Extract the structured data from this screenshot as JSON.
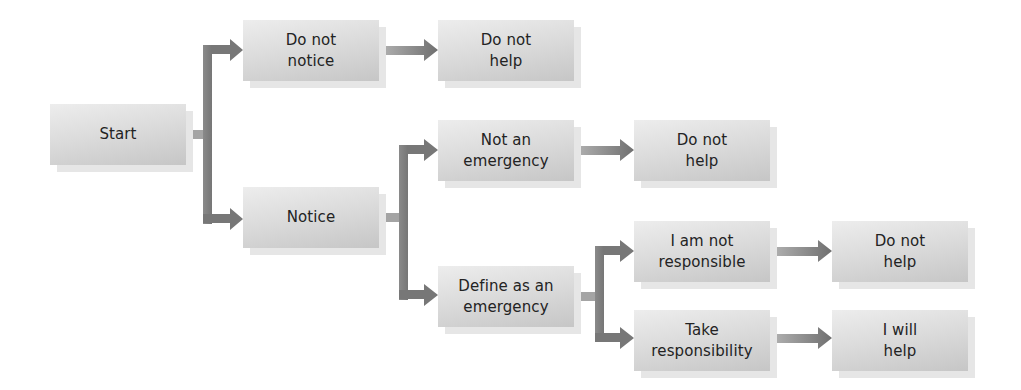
{
  "diagram": {
    "type": "decision-flowchart",
    "nodes": {
      "start": {
        "label": "Start"
      },
      "do_not_notice": {
        "label": "Do not\nnotice"
      },
      "do_not_help_1": {
        "label": "Do not\nhelp"
      },
      "notice": {
        "label": "Notice"
      },
      "not_an_emergency": {
        "label": "Not an\nemergency"
      },
      "do_not_help_2": {
        "label": "Do not\nhelp"
      },
      "define_as_emergency": {
        "label": "Define as an\nemergency"
      },
      "i_am_not_responsible": {
        "label": "I am not\nresponsible"
      },
      "do_not_help_3": {
        "label": "Do not\nhelp"
      },
      "take_responsibility": {
        "label": "Take\nresponsibility"
      },
      "i_will_help": {
        "label": "I will\nhelp"
      }
    },
    "edges": [
      {
        "from": "start",
        "to": "do_not_notice"
      },
      {
        "from": "start",
        "to": "notice"
      },
      {
        "from": "do_not_notice",
        "to": "do_not_help_1"
      },
      {
        "from": "notice",
        "to": "not_an_emergency"
      },
      {
        "from": "notice",
        "to": "define_as_emergency"
      },
      {
        "from": "not_an_emergency",
        "to": "do_not_help_2"
      },
      {
        "from": "define_as_emergency",
        "to": "i_am_not_responsible"
      },
      {
        "from": "define_as_emergency",
        "to": "take_responsibility"
      },
      {
        "from": "i_am_not_responsible",
        "to": "do_not_help_3"
      },
      {
        "from": "take_responsibility",
        "to": "i_will_help"
      }
    ],
    "colors": {
      "box_top": "#ededed",
      "box_bottom": "#c6c6c6",
      "box_shadow": "#e6e6e6",
      "arrow": "#7b7b7b",
      "arrow_light": "#a9a9a9",
      "text": "#232323"
    }
  }
}
